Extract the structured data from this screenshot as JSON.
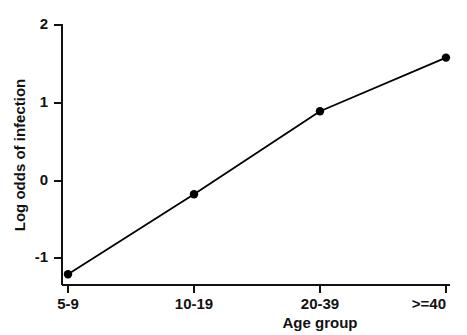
{
  "chart_data": {
    "type": "line",
    "title": "",
    "subtitle": "",
    "xlabel": "Age group",
    "ylabel": "Log odds of infection",
    "categories": [
      "5-9",
      "10-19",
      "20-39",
      ">=40"
    ],
    "values": [
      -1.21,
      -0.18,
      0.89,
      1.58
    ],
    "series": [
      {
        "name": "Log odds of infection",
        "values": [
          -1.21,
          -0.18,
          0.89,
          1.58
        ]
      }
    ],
    "x_tick_labels": [
      "5-9",
      "10-19",
      "20-39",
      ">=40"
    ],
    "y_tick_labels": [
      "2",
      "1",
      "0",
      "-1"
    ],
    "y_tick_values": [
      2,
      1,
      0,
      -1
    ],
    "ylim": [
      -1.35,
      2.15
    ],
    "xlim": [
      0,
      3
    ],
    "grid": false,
    "legend": null,
    "legend_position": "none",
    "marker": "filled-circle",
    "marker_color": "#000000",
    "line_color": "#000000",
    "annotations": []
  },
  "figure": {
    "background_color": "#ffffff",
    "axis_color": "#111111",
    "text_color": "#111111"
  },
  "axes": {
    "y_axis_title": "Log odds of infection",
    "x_axis_title": "Age group"
  }
}
